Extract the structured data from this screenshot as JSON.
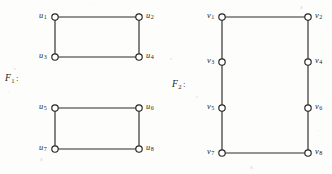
{
  "figure": {
    "background_color": "#fdfdfb",
    "ink_color": "#242424",
    "width": 332,
    "height": 174,
    "graphs": [
      {
        "id": "F1",
        "name": "F",
        "name_subscript": "1",
        "colon": ":",
        "label_x": 5,
        "label_y": 73,
        "description": "two disjoint four-cycles",
        "vertices": [
          {
            "id": "u1",
            "letter": "u",
            "subscript": "1",
            "cx": 55,
            "cy": 17,
            "label_x": 39,
            "label_y": 12,
            "label_side": "left"
          },
          {
            "id": "u2",
            "letter": "u",
            "subscript": "2",
            "cx": 139,
            "cy": 17,
            "label_x": 146,
            "label_y": 12,
            "label_side": "right"
          },
          {
            "id": "u3",
            "letter": "u",
            "subscript": "3",
            "cx": 55,
            "cy": 57,
            "label_x": 39,
            "label_y": 52,
            "label_side": "left"
          },
          {
            "id": "u4",
            "letter": "u",
            "subscript": "4",
            "cx": 139,
            "cy": 57,
            "label_x": 146,
            "label_y": 52,
            "label_side": "right"
          },
          {
            "id": "u5",
            "letter": "u",
            "subscript": "5",
            "cx": 55,
            "cy": 108,
            "label_x": 39,
            "label_y": 103,
            "label_side": "left"
          },
          {
            "id": "u6",
            "letter": "u",
            "subscript": "6",
            "cx": 139,
            "cy": 108,
            "label_x": 146,
            "label_y": 103,
            "label_side": "right"
          },
          {
            "id": "u7",
            "letter": "u",
            "subscript": "7",
            "cx": 55,
            "cy": 149,
            "label_x": 39,
            "label_y": 144,
            "label_side": "left"
          },
          {
            "id": "u8",
            "letter": "u",
            "subscript": "8",
            "cx": 139,
            "cy": 149,
            "label_x": 146,
            "label_y": 144,
            "label_side": "right"
          }
        ],
        "edges": [
          {
            "from": "u1",
            "to": "u2"
          },
          {
            "from": "u1",
            "to": "u3"
          },
          {
            "from": "u3",
            "to": "u4"
          },
          {
            "from": "u2",
            "to": "u4"
          },
          {
            "from": "u5",
            "to": "u6"
          },
          {
            "from": "u5",
            "to": "u7"
          },
          {
            "from": "u7",
            "to": "u8"
          },
          {
            "from": "u6",
            "to": "u8"
          }
        ]
      },
      {
        "id": "F2",
        "name": "F",
        "name_subscript": "2",
        "colon": ":",
        "label_x": 172,
        "label_y": 79,
        "description": "single eight-cycle",
        "vertices": [
          {
            "id": "v1",
            "letter": "v",
            "subscript": "1",
            "cx": 222,
            "cy": 17,
            "label_x": 207,
            "label_y": 12,
            "label_side": "left"
          },
          {
            "id": "v2",
            "letter": "v",
            "subscript": "2",
            "cx": 308,
            "cy": 17,
            "label_x": 315,
            "label_y": 12,
            "label_side": "right"
          },
          {
            "id": "v3",
            "letter": "v",
            "subscript": "3",
            "cx": 222,
            "cy": 62,
            "label_x": 207,
            "label_y": 57,
            "label_side": "left"
          },
          {
            "id": "v4",
            "letter": "v",
            "subscript": "4",
            "cx": 308,
            "cy": 62,
            "label_x": 315,
            "label_y": 57,
            "label_side": "right"
          },
          {
            "id": "v5",
            "letter": "v",
            "subscript": "5",
            "cx": 222,
            "cy": 108,
            "label_x": 207,
            "label_y": 103,
            "label_side": "left"
          },
          {
            "id": "v6",
            "letter": "v",
            "subscript": "6",
            "cx": 308,
            "cy": 108,
            "label_x": 315,
            "label_y": 103,
            "label_side": "right"
          },
          {
            "id": "v7",
            "letter": "v",
            "subscript": "7",
            "cx": 222,
            "cy": 153,
            "label_x": 207,
            "label_y": 148,
            "label_side": "left"
          },
          {
            "id": "v8",
            "letter": "v",
            "subscript": "8",
            "cx": 308,
            "cy": 153,
            "label_x": 315,
            "label_y": 148,
            "label_side": "right"
          }
        ],
        "edges": [
          {
            "from": "v1",
            "to": "v2"
          },
          {
            "from": "v1",
            "to": "v3"
          },
          {
            "from": "v3",
            "to": "v5"
          },
          {
            "from": "v5",
            "to": "v7"
          },
          {
            "from": "v7",
            "to": "v8"
          },
          {
            "from": "v2",
            "to": "v4"
          },
          {
            "from": "v4",
            "to": "v6"
          },
          {
            "from": "v6",
            "to": "v8"
          }
        ]
      }
    ],
    "vertex_radius": 3.2
  }
}
